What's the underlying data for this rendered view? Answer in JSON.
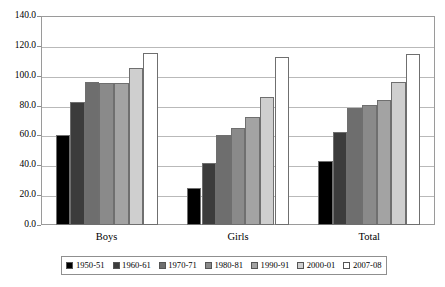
{
  "chart_data": {
    "type": "bar",
    "title": "",
    "subtitle": "",
    "xlabel": "",
    "ylabel": "",
    "categories": [
      "Boys",
      "Girls",
      "Total"
    ],
    "ylim": [
      0.0,
      140.0
    ],
    "ytick_labels": [
      "140.0",
      "120.0",
      "100.0",
      "80.0",
      "60.0",
      "40.0",
      "20.0",
      "0.0"
    ],
    "ytick_values": [
      140.0,
      120.0,
      100.0,
      80.0,
      60.0,
      40.0,
      20.0,
      0.0
    ],
    "grid": true,
    "legend_position": "bottom",
    "series": [
      {
        "name": "1950-51",
        "color": "#000000",
        "values": [
          60.6,
          24.8,
          42.6
        ]
      },
      {
        "name": "1960-61",
        "color": "#3c3c3c",
        "values": [
          82.6,
          41.3,
          62.4
        ]
      },
      {
        "name": "1970-71",
        "color": "#6e6e6e",
        "values": [
          96.0,
          60.5,
          78.6
        ]
      },
      {
        "name": "1980-81",
        "color": "#8a8a8a",
        "values": [
          95.3,
          64.8,
          80.5
        ]
      },
      {
        "name": "1990-91",
        "color": "#a3a3a3",
        "values": [
          95.0,
          72.3,
          84.0
        ]
      },
      {
        "name": "2000-01",
        "color": "#cfcfcf",
        "values": [
          104.9,
          85.9,
          95.6
        ]
      },
      {
        "name": "2007-08",
        "color": "#ffffff",
        "values": [
          115.3,
          112.6,
          114.6
        ]
      }
    ]
  }
}
